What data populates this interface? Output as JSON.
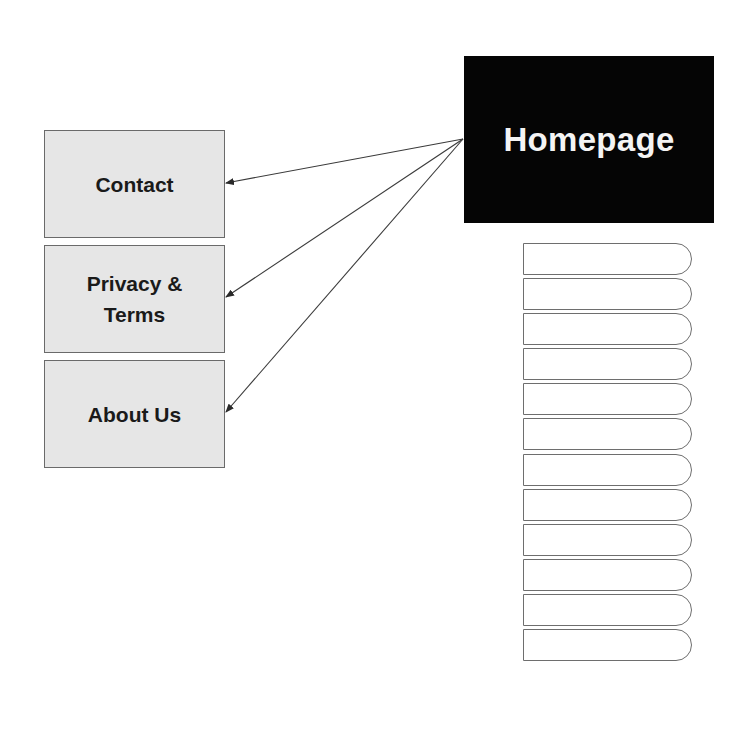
{
  "diagram": {
    "root": {
      "label": "Homepage",
      "fill": "#050505",
      "text_color": "#f4f4f4"
    },
    "linked_pages": [
      {
        "id": "contact",
        "lines": [
          "Contact"
        ]
      },
      {
        "id": "privacy-terms",
        "lines": [
          "Privacy &",
          "Terms"
        ]
      },
      {
        "id": "about-us",
        "lines": [
          "About Us"
        ]
      }
    ],
    "box_fill": "#e6e6e6",
    "box_border": "#6a6a6a",
    "edges": [
      {
        "from": "Homepage",
        "to": "Contact"
      },
      {
        "from": "Homepage",
        "to": "Privacy & Terms"
      },
      {
        "from": "Homepage",
        "to": "About Us"
      }
    ],
    "stacked_tabs": {
      "count": 12,
      "labels": [
        "",
        "",
        "",
        "",
        "",
        "",
        "",
        "",
        "",
        "",
        "",
        ""
      ]
    }
  }
}
